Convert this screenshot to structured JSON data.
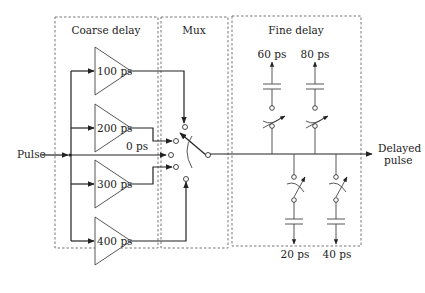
{
  "diagram": {
    "input_label": "Pulse",
    "output_label_line1": "Delayed",
    "output_label_line2": "pulse",
    "sections": {
      "coarse": {
        "label": "Coarse delay"
      },
      "mux": {
        "label": "Mux"
      },
      "fine": {
        "label": "Fine delay"
      }
    },
    "coarse_buffers": [
      {
        "label": "100 ps"
      },
      {
        "label": "200 ps"
      },
      {
        "label": "300 ps"
      },
      {
        "label": "400 ps"
      }
    ],
    "bypass_label": "0 ps",
    "fine_caps_top": [
      {
        "label": "60 ps"
      },
      {
        "label": "80 ps"
      }
    ],
    "fine_caps_bottom": [
      {
        "label": "20 ps"
      },
      {
        "label": "40 ps"
      }
    ]
  }
}
